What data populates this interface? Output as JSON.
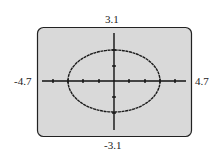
{
  "window": {
    "xmin": "-4.7",
    "xmax": "4.7",
    "ymin": "-3.1",
    "ymax": "3.1"
  },
  "graph": {
    "type": "ellipse",
    "center": [
      0,
      0
    ],
    "semi_axis_x": 3,
    "semi_axis_y": 2,
    "screen_background": "#d9d9d9",
    "curve_color": "#1a1a1a"
  }
}
